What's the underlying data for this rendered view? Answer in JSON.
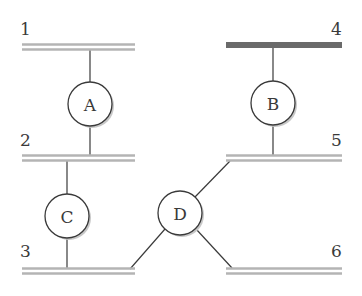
{
  "diagram": {
    "buses": [
      {
        "id": "1",
        "label": "1",
        "style": "double",
        "x1": 22,
        "x2": 135,
        "y": 47,
        "label_x": 20,
        "label_y": 35
      },
      {
        "id": "2",
        "label": "2",
        "style": "double",
        "x1": 22,
        "x2": 135,
        "y": 158,
        "label_x": 20,
        "label_y": 146
      },
      {
        "id": "3",
        "label": "3",
        "style": "double",
        "x1": 22,
        "x2": 135,
        "y": 271,
        "label_x": 20,
        "label_y": 257
      },
      {
        "id": "4",
        "label": "4",
        "style": "heavy",
        "x1": 226,
        "x2": 342,
        "y": 45,
        "label_x": 331,
        "label_y": 35
      },
      {
        "id": "5",
        "label": "5",
        "style": "double",
        "x1": 226,
        "x2": 342,
        "y": 158,
        "label_x": 331,
        "label_y": 146
      },
      {
        "id": "6",
        "label": "6",
        "style": "double",
        "x1": 226,
        "x2": 342,
        "y": 271,
        "label_x": 331,
        "label_y": 257
      }
    ],
    "nodes": [
      {
        "id": "A",
        "label": "A",
        "cx": 90,
        "cy": 104,
        "r": 22
      },
      {
        "id": "B",
        "label": "B",
        "cx": 273,
        "cy": 103,
        "r": 22
      },
      {
        "id": "C",
        "label": "C",
        "cx": 67,
        "cy": 216,
        "r": 22
      },
      {
        "id": "D",
        "label": "D",
        "cx": 180,
        "cy": 213,
        "r": 22
      }
    ],
    "connections": [
      {
        "from": "bus-1",
        "to": "A",
        "x1": 90,
        "y1": 49,
        "x2": 90,
        "y2": 82
      },
      {
        "from": "A",
        "to": "bus-2",
        "x1": 90,
        "y1": 126,
        "x2": 90,
        "y2": 156
      },
      {
        "from": "bus-4",
        "to": "B",
        "x1": 273,
        "y1": 48,
        "x2": 273,
        "y2": 81
      },
      {
        "from": "B",
        "to": "bus-5",
        "x1": 273,
        "y1": 125,
        "x2": 273,
        "y2": 156
      },
      {
        "from": "bus-2",
        "to": "C",
        "x1": 67,
        "y1": 160,
        "x2": 67,
        "y2": 194
      },
      {
        "from": "C",
        "to": "bus-3",
        "x1": 67,
        "y1": 238,
        "x2": 67,
        "y2": 269
      },
      {
        "from": "D",
        "to": "bus-5",
        "x1": 195,
        "y1": 197,
        "x2": 230,
        "y2": 161
      },
      {
        "from": "D",
        "to": "bus-3",
        "x1": 165,
        "y1": 229,
        "x2": 130,
        "y2": 269
      },
      {
        "from": "D",
        "to": "bus-6",
        "x1": 196,
        "y1": 229,
        "x2": 232,
        "y2": 268
      }
    ]
  }
}
